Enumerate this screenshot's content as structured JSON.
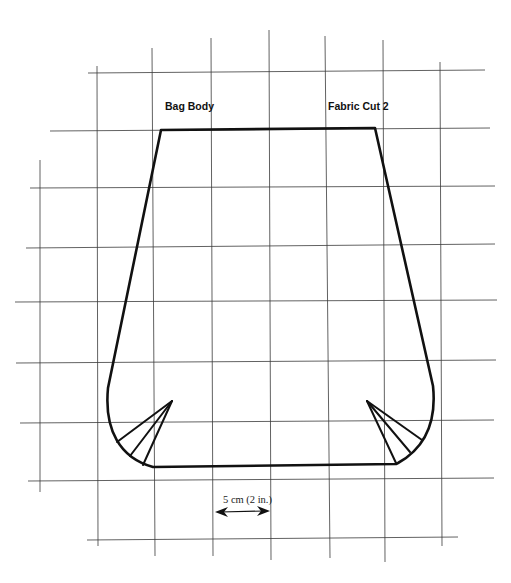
{
  "pattern": {
    "title": "Bag Body",
    "cut_instruction": "Fabric Cut 2"
  },
  "scale": {
    "label": "5 cm (2 in.)"
  },
  "colors": {
    "outline": "#111111",
    "grid": "#3a3a3a",
    "background": "#ffffff"
  }
}
